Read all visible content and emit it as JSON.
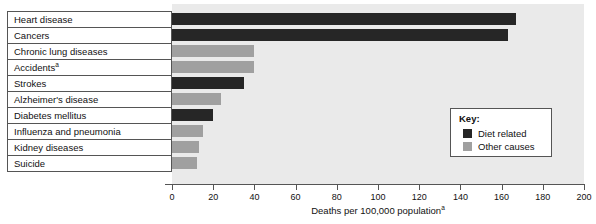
{
  "chart_data": {
    "type": "bar",
    "orientation": "horizontal",
    "title": "",
    "xlabel": "Deaths per 100,000 population",
    "xlabel_superscript": "a",
    "ylabel": "",
    "xlim": [
      0,
      200
    ],
    "grid": false,
    "categories": [
      "Heart disease",
      "Cancers",
      "Chronic lung diseases",
      "Accidents",
      "Strokes",
      "Alzheimer's disease",
      "Diabetes mellitus",
      "Influenza and pneumonia",
      "Kidney diseases",
      "Suicide"
    ],
    "category_superscripts": [
      "",
      "",
      "",
      "a",
      "",
      "",
      "",
      "",
      "",
      ""
    ],
    "values": [
      167,
      163,
      40,
      40,
      35,
      24,
      20,
      15,
      13,
      12
    ],
    "groups": [
      "diet",
      "diet",
      "other",
      "other",
      "diet",
      "other",
      "diet",
      "other",
      "other",
      "other"
    ],
    "tick_values": [
      0,
      20,
      40,
      60,
      80,
      100,
      120,
      140,
      160,
      180,
      200
    ],
    "tick_labels": [
      "0",
      "20",
      "40",
      "60",
      "80",
      "100",
      "120",
      "140",
      "160",
      "180",
      "200"
    ],
    "legend": {
      "position": "inside-right",
      "title": "Key:",
      "entries": [
        {
          "key": "diet",
          "label": "Diet related",
          "color": "#262626"
        },
        {
          "key": "other",
          "label": "Other causes",
          "color": "#a0a0a0"
        }
      ]
    },
    "colors": {
      "diet_related": "#262626",
      "other_causes": "#a0a0a0",
      "plot_background": "#eaeaea",
      "axis": "#555555",
      "text": "#111111"
    }
  }
}
